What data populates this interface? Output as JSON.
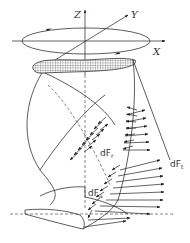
{
  "diagram": {
    "axes": {
      "x_label": "X",
      "y_label": "Y",
      "z_label": "Z"
    },
    "force_labels": {
      "radial": "dF",
      "radial_sub": "r",
      "tangential": "dF",
      "tangential_sub": "t",
      "axial": "dF",
      "axial_sub": "a"
    },
    "colors": {
      "line": "#333333",
      "hatch_fill": "#888888",
      "background": "#ffffff"
    }
  }
}
